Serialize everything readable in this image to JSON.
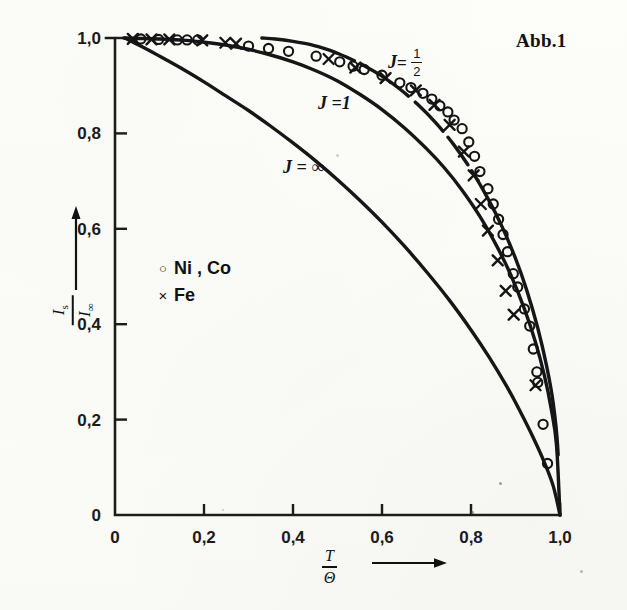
{
  "figure": {
    "title": "Abb.1",
    "background_color": "#fbfbf8",
    "ink_color": "#141414"
  },
  "axes": {
    "x_ticklabels": [
      "0",
      "0,2",
      "0,4",
      "0,6",
      "0,8",
      "1,0"
    ],
    "x_tickvalues": [
      0,
      0.2,
      0.4,
      0.6,
      0.8,
      1.0
    ],
    "y_ticklabels": [
      "0",
      "0,2",
      "0,4",
      "0,6",
      "0,8",
      "1,0"
    ],
    "y_tickvalues": [
      0,
      0.2,
      0.4,
      0.6,
      0.8,
      1.0
    ],
    "xlabel_numerator": "T",
    "xlabel_denominator": "Θ",
    "ylabel_numerator": "I",
    "ylabel_numerator_sub": "s",
    "ylabel_denominator": "I",
    "ylabel_denominator_sub": "∞"
  },
  "legend": {
    "entries": [
      {
        "marker": "circle-marker",
        "glyph": "○",
        "label": "Ni , Co"
      },
      {
        "marker": "cross-marker",
        "glyph": "×",
        "label": "Fe"
      }
    ]
  },
  "curve_labels": [
    {
      "name": "j-one-half-label",
      "prefix": "J",
      "eq": "=",
      "num": "1",
      "den": "2"
    },
    {
      "name": "j-one-label",
      "text": "J =1"
    },
    {
      "name": "j-infinity-label",
      "text": "J = ∞"
    }
  ],
  "chart_data": {
    "type": "line",
    "title": "Abb.1",
    "xlabel": "T/Θ",
    "ylabel": "I_s/I_∞",
    "xlim": [
      0,
      1.0
    ],
    "ylim": [
      0,
      1.0
    ],
    "grid": false,
    "legend_position": "middle-left",
    "series": [
      {
        "name": "J = 1/2",
        "kind": "curve",
        "style": "solid-with-break",
        "annotation": "J = 1/2",
        "points": [
          [
            0.33,
            1.0
          ],
          [
            0.36,
            0.998
          ],
          [
            0.4,
            0.993
          ],
          [
            0.44,
            0.986
          ],
          [
            0.48,
            0.975
          ],
          [
            0.5,
            0.968
          ],
          [
            0.52,
            0.96
          ],
          [
            0.56,
            0.942
          ],
          [
            0.6,
            0.92
          ],
          [
            0.64,
            0.893
          ],
          [
            0.68,
            0.861
          ],
          [
            0.72,
            0.823
          ],
          [
            0.76,
            0.778
          ],
          [
            0.8,
            0.724
          ],
          [
            0.84,
            0.66
          ],
          [
            0.87,
            0.604
          ],
          [
            0.9,
            0.538
          ],
          [
            0.925,
            0.472
          ],
          [
            0.95,
            0.392
          ],
          [
            0.97,
            0.312
          ],
          [
            0.985,
            0.233
          ],
          [
            0.995,
            0.14
          ],
          [
            1.0,
            0.0
          ]
        ]
      },
      {
        "name": "J = 1",
        "kind": "curve",
        "style": "solid",
        "annotation": "J = 1",
        "points": [
          [
            0.02,
            1.0
          ],
          [
            0.1,
            0.998
          ],
          [
            0.16,
            0.995
          ],
          [
            0.22,
            0.989
          ],
          [
            0.28,
            0.98
          ],
          [
            0.34,
            0.967
          ],
          [
            0.4,
            0.95
          ],
          [
            0.45,
            0.932
          ],
          [
            0.5,
            0.91
          ],
          [
            0.55,
            0.882
          ],
          [
            0.6,
            0.85
          ],
          [
            0.65,
            0.812
          ],
          [
            0.7,
            0.768
          ],
          [
            0.74,
            0.728
          ],
          [
            0.78,
            0.681
          ],
          [
            0.82,
            0.626
          ],
          [
            0.86,
            0.56
          ],
          [
            0.89,
            0.502
          ],
          [
            0.92,
            0.432
          ],
          [
            0.945,
            0.362
          ],
          [
            0.965,
            0.292
          ],
          [
            0.98,
            0.224
          ],
          [
            0.992,
            0.148
          ],
          [
            1.0,
            0.0
          ]
        ]
      },
      {
        "name": "J = ∞",
        "kind": "curve",
        "style": "solid",
        "annotation": "J = ∞",
        "points": [
          [
            0.022,
            1.0
          ],
          [
            0.06,
            0.982
          ],
          [
            0.1,
            0.962
          ],
          [
            0.15,
            0.936
          ],
          [
            0.2,
            0.908
          ],
          [
            0.25,
            0.878
          ],
          [
            0.3,
            0.848
          ],
          [
            0.35,
            0.815
          ],
          [
            0.4,
            0.78
          ],
          [
            0.45,
            0.743
          ],
          [
            0.5,
            0.703
          ],
          [
            0.55,
            0.66
          ],
          [
            0.6,
            0.614
          ],
          [
            0.65,
            0.564
          ],
          [
            0.7,
            0.51
          ],
          [
            0.75,
            0.452
          ],
          [
            0.8,
            0.388
          ],
          [
            0.84,
            0.332
          ],
          [
            0.88,
            0.27
          ],
          [
            0.91,
            0.218
          ],
          [
            0.94,
            0.162
          ],
          [
            0.965,
            0.11
          ],
          [
            0.985,
            0.06
          ],
          [
            1.0,
            0.0
          ]
        ]
      }
    ],
    "scatter": [
      {
        "name": "Ni , Co",
        "marker": "circle",
        "points": [
          [
            0.058,
            0.998
          ],
          [
            0.098,
            0.997
          ],
          [
            0.14,
            0.996
          ],
          [
            0.162,
            0.996
          ],
          [
            0.186,
            0.996
          ],
          [
            0.3,
            0.983
          ],
          [
            0.345,
            0.978
          ],
          [
            0.39,
            0.972
          ],
          [
            0.452,
            0.962
          ],
          [
            0.505,
            0.95
          ],
          [
            0.535,
            0.941
          ],
          [
            0.56,
            0.934
          ],
          [
            0.6,
            0.922
          ],
          [
            0.64,
            0.906
          ],
          [
            0.665,
            0.896
          ],
          [
            0.692,
            0.884
          ],
          [
            0.712,
            0.872
          ],
          [
            0.73,
            0.858
          ],
          [
            0.748,
            0.845
          ],
          [
            0.762,
            0.828
          ],
          [
            0.78,
            0.81
          ],
          [
            0.795,
            0.782
          ],
          [
            0.808,
            0.752
          ],
          [
            0.82,
            0.72
          ],
          [
            0.838,
            0.684
          ],
          [
            0.85,
            0.652
          ],
          [
            0.862,
            0.62
          ],
          [
            0.872,
            0.588
          ],
          [
            0.882,
            0.552
          ],
          [
            0.895,
            0.506
          ],
          [
            0.905,
            0.478
          ],
          [
            0.92,
            0.432
          ],
          [
            0.932,
            0.396
          ],
          [
            0.94,
            0.348
          ],
          [
            0.948,
            0.3
          ],
          [
            0.95,
            0.278
          ],
          [
            0.962,
            0.19
          ],
          [
            0.972,
            0.108
          ]
        ]
      },
      {
        "name": "Fe",
        "marker": "cross",
        "points": [
          [
            0.04,
            0.998
          ],
          [
            0.082,
            0.997
          ],
          [
            0.122,
            0.997
          ],
          [
            0.196,
            0.995
          ],
          [
            0.248,
            0.99
          ],
          [
            0.272,
            0.988
          ],
          [
            0.48,
            0.956
          ],
          [
            0.54,
            0.938
          ],
          [
            0.608,
            0.916
          ],
          [
            0.676,
            0.89
          ],
          [
            0.718,
            0.86
          ],
          [
            0.752,
            0.818
          ],
          [
            0.784,
            0.762
          ],
          [
            0.806,
            0.712
          ],
          [
            0.822,
            0.652
          ],
          [
            0.838,
            0.596
          ],
          [
            0.86,
            0.534
          ],
          [
            0.878,
            0.47
          ],
          [
            0.896,
            0.42
          ],
          [
            0.945,
            0.272
          ]
        ]
      }
    ]
  }
}
